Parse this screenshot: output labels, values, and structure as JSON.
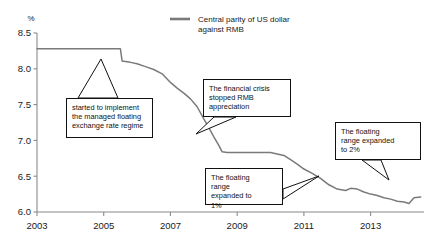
{
  "chart_data": {
    "type": "line",
    "title": "",
    "xlabel": "",
    "ylabel": "%",
    "ylim": [
      6.0,
      8.5
    ],
    "xlim": [
      2003.0,
      2014.6
    ],
    "yticks": [
      "6.0",
      "6.5",
      "7.0",
      "7.5",
      "8.0",
      "8.5"
    ],
    "ytick_values": [
      6.0,
      6.5,
      7.0,
      7.5,
      8.0,
      8.5
    ],
    "xticks": [
      "2003",
      "2005",
      "2007",
      "2009",
      "2011",
      "2013"
    ],
    "xtick_values": [
      2003,
      2005,
      2007,
      2009,
      2011,
      2013
    ],
    "grid": false,
    "legend_position": "top-center",
    "series": [
      {
        "name": "Central parity of US dollar against RMB",
        "color": "#7a7a7a",
        "x": [
          2003.0,
          2004.0,
          2005.0,
          2005.5,
          2005.55,
          2005.8,
          2006.0,
          2006.25,
          2006.5,
          2006.75,
          2007.0,
          2007.2,
          2007.4,
          2007.6,
          2007.8,
          2008.0,
          2008.15,
          2008.3,
          2008.45,
          2008.55,
          2008.7,
          2009.0,
          2009.5,
          2010.0,
          2010.4,
          2010.6,
          2010.8,
          2011.0,
          2011.25,
          2011.5,
          2011.75,
          2012.0,
          2012.25,
          2012.4,
          2012.6,
          2012.8,
          2013.0,
          2013.2,
          2013.4,
          2013.6,
          2013.8,
          2014.0,
          2014.15,
          2014.3,
          2014.5
        ],
        "y": [
          8.28,
          8.28,
          8.28,
          8.28,
          8.11,
          8.09,
          8.07,
          8.03,
          7.99,
          7.93,
          7.81,
          7.73,
          7.66,
          7.58,
          7.47,
          7.3,
          7.18,
          7.05,
          6.93,
          6.84,
          6.83,
          6.83,
          6.83,
          6.83,
          6.79,
          6.73,
          6.67,
          6.6,
          6.54,
          6.47,
          6.38,
          6.32,
          6.3,
          6.33,
          6.32,
          6.28,
          6.25,
          6.23,
          6.2,
          6.18,
          6.15,
          6.14,
          6.12,
          6.2,
          6.21
        ]
      }
    ],
    "annotations": [
      {
        "id": "managed-float",
        "text": "started to implement the managed floating exchange rate regime",
        "lines": [
          "started to implement",
          "the managed floating",
          "exchange rate regime"
        ],
        "points_to_x": 2005.55,
        "points_to_y": 8.11
      },
      {
        "id": "financial-crisis",
        "text": "The financial crisis stopped RMB appreciation",
        "lines": [
          "The financial crisis",
          "stopped RMB",
          "appreciation"
        ],
        "points_to_x": 2008.55,
        "points_to_y": 6.84
      },
      {
        "id": "float-range-1pct",
        "text": "The floating range expanded to 1%",
        "lines": [
          "The floating",
          "range",
          "expanded to",
          "1%"
        ],
        "points_to_x": 2010.4,
        "points_to_y": 6.79
      },
      {
        "id": "float-range-2pct",
        "text": "The floating range expanded to 2%",
        "lines": [
          "The floating",
          "range expanded",
          "to 2%"
        ],
        "points_to_x": 2014.1,
        "points_to_y": 6.13
      }
    ]
  },
  "legend": {
    "entries": [
      {
        "label_line1": "Central parity of US dollar",
        "label_line2": "against RMB",
        "color": "#7a7a7a"
      }
    ]
  },
  "axes": {
    "y_unit": "%",
    "axis_color": "#8a8a8a"
  }
}
